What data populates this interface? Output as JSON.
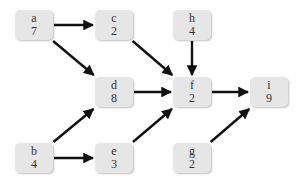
{
  "diagram": {
    "type": "directed-acyclic-graph",
    "nodes": [
      {
        "id": "a",
        "label": "a",
        "value": "7",
        "x": 15,
        "y": 10
      },
      {
        "id": "c",
        "label": "c",
        "value": "2",
        "x": 95,
        "y": 10
      },
      {
        "id": "h",
        "label": "h",
        "value": "4",
        "x": 173,
        "y": 10
      },
      {
        "id": "d",
        "label": "d",
        "value": "8",
        "x": 95,
        "y": 77
      },
      {
        "id": "f",
        "label": "f",
        "value": "2",
        "x": 173,
        "y": 77
      },
      {
        "id": "i",
        "label": "i",
        "value": "9",
        "x": 250,
        "y": 77
      },
      {
        "id": "b",
        "label": "b",
        "value": "4",
        "x": 15,
        "y": 143
      },
      {
        "id": "e",
        "label": "e",
        "value": "3",
        "x": 95,
        "y": 143
      },
      {
        "id": "g",
        "label": "g",
        "value": "2",
        "x": 173,
        "y": 143
      }
    ],
    "edges": [
      {
        "from": "a",
        "to": "c"
      },
      {
        "from": "a",
        "to": "d"
      },
      {
        "from": "c",
        "to": "f"
      },
      {
        "from": "h",
        "to": "f"
      },
      {
        "from": "d",
        "to": "f"
      },
      {
        "from": "f",
        "to": "i"
      },
      {
        "from": "b",
        "to": "d"
      },
      {
        "from": "b",
        "to": "e"
      },
      {
        "from": "e",
        "to": "f"
      },
      {
        "from": "g",
        "to": "i"
      }
    ],
    "colors": {
      "node_fill": "#e6e6e6",
      "edge": "#111111",
      "text": "#333333"
    }
  }
}
